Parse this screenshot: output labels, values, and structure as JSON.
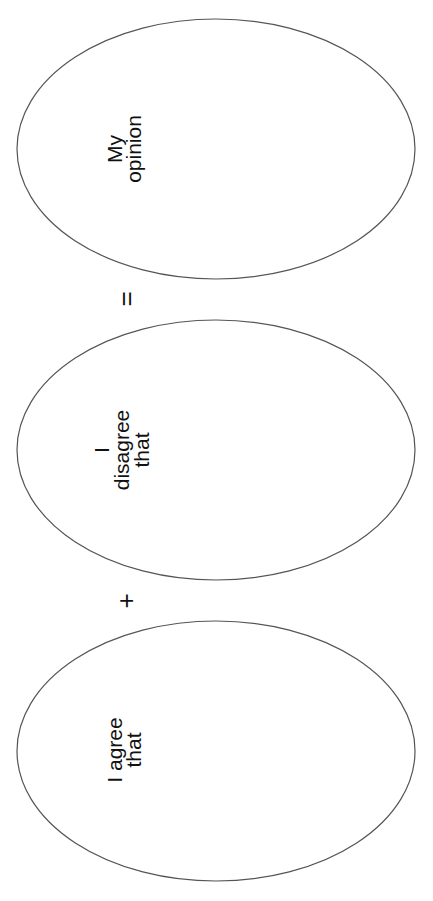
{
  "diagram": {
    "orientation": "rotated -90deg (reads bottom-to-top)",
    "stroke_color": "#555555",
    "background": "#ffffff",
    "text_color": "#111111",
    "ellipses": [
      {
        "id": "result",
        "position": "top",
        "lines": [
          "My",
          "opinion"
        ]
      },
      {
        "id": "disagree",
        "position": "middle",
        "lines": [
          "I",
          "disagree",
          "that"
        ]
      },
      {
        "id": "agree",
        "position": "bottom",
        "lines": [
          "I agree",
          "that"
        ]
      }
    ],
    "operators": {
      "plus": "+",
      "equals": "="
    }
  }
}
